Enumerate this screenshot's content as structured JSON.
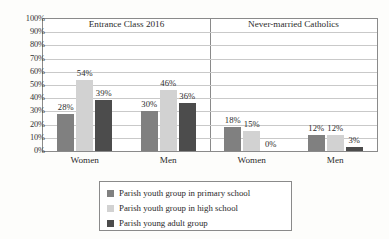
{
  "chart_data": {
    "type": "bar",
    "title": "",
    "xlabel": "",
    "ylabel": "",
    "ylim": [
      0,
      100
    ],
    "grid": true,
    "legend_position": "bottom",
    "panels": [
      {
        "title": "Entrance Class 2016",
        "categories": [
          "Women",
          "Men"
        ],
        "values": [
          [
            28,
            54,
            39
          ],
          [
            30,
            46,
            36
          ]
        ],
        "labels": [
          [
            "28%",
            "54%",
            "39%"
          ],
          [
            "30%",
            "46%",
            "36%"
          ]
        ]
      },
      {
        "title": "Never-married Catholics",
        "categories": [
          "Women",
          "Men"
        ],
        "values": [
          [
            18,
            15,
            0
          ],
          [
            12,
            12,
            3
          ]
        ],
        "labels": [
          [
            "18%",
            "15%",
            "0%"
          ],
          [
            "12%",
            "12%",
            "3%"
          ]
        ]
      }
    ],
    "series": [
      {
        "name": "Parish youth group in primary school",
        "color": "#808080"
      },
      {
        "name": "Parish youth group in high school",
        "color": "#d2d2d2"
      },
      {
        "name": "Parish young adult group",
        "color": "#4c4c4c"
      }
    ],
    "yticks": [
      "100%",
      "90%",
      "80%",
      "70%",
      "60%",
      "50%",
      "40%",
      "30%",
      "20%",
      "10%",
      "0%"
    ],
    "ytick_values": [
      100,
      90,
      80,
      70,
      60,
      50,
      40,
      30,
      20,
      10,
      0
    ]
  },
  "legend": {
    "items": [
      {
        "label": "Parish youth group in primary school",
        "color": "#808080"
      },
      {
        "label": "Parish youth group in high school",
        "color": "#d2d2d2"
      },
      {
        "label": "Parish young adult group",
        "color": "#4c4c4c"
      }
    ]
  }
}
